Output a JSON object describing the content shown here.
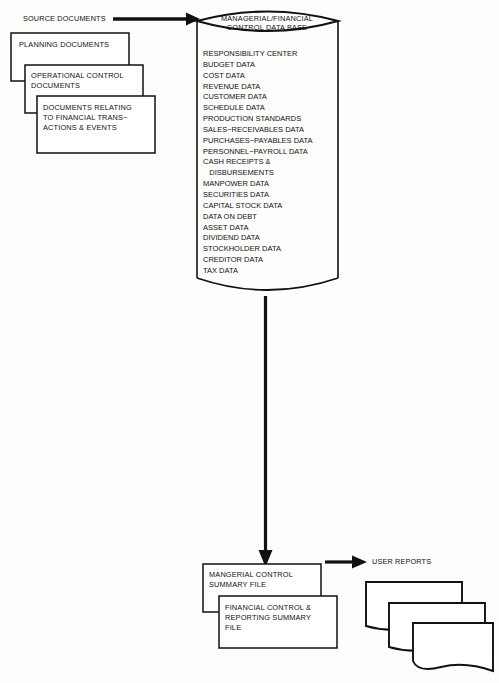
{
  "diagram": {
    "source_label": "SOURCE DOCUMENTS",
    "source_documents": [
      {
        "id": "planning",
        "lines": "PLANNING DOCUMENTS"
      },
      {
        "id": "operational",
        "lines": "OPERATIONAL CONTROL\nDOCUMENTS"
      },
      {
        "id": "transactions",
        "lines": "DOCUMENTS RELATING\nTO FINANCIAL TRANS−\nACTIONS & EVENTS"
      }
    ],
    "database": {
      "title": "MANAGERIAL/FINANCIAL\nCONTROL DATA BASE",
      "items": [
        "RESPONSIBILITY CENTER",
        "BUDGET DATA",
        "COST DATA",
        "REVENUE DATA",
        "CUSTOMER DATA",
        "SCHEDULE DATA",
        "PRODUCTION STANDARDS",
        "SALES−RECEIVABLES DATA",
        "PURCHASES−PAYABLES DATA",
        "PERSONNEL−PAYROLL DATA",
        "CASH RECEIPTS &",
        "   DISBURSEMENTS",
        "MANPOWER DATA",
        "SECURITIES DATA",
        "CAPITAL STOCK DATA",
        "DATA ON DEBT",
        "ASSET DATA",
        "DIVIDEND DATA",
        "STOCKHOLDER DATA",
        "CREDITOR DATA",
        "TAX DATA"
      ]
    },
    "output_files": [
      {
        "id": "managerial-summary",
        "lines": "MANGERIAL CONTROL\nSUMMARY FILE"
      },
      {
        "id": "financial-summary",
        "lines": "FINANCIAL CONTROL &\nREPORTING SUMMARY\nFILE"
      }
    ],
    "user_reports_label": "USER REPORTS",
    "colors": {
      "stroke": "#111111",
      "background": "#ffffff",
      "arrow": "#111111"
    }
  }
}
